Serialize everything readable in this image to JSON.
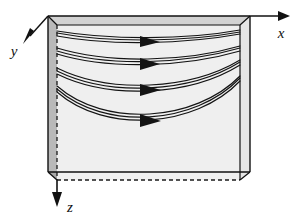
{
  "figure": {
    "title": "",
    "type": "3d-duct-streamline-diagram",
    "background_color": "#ffffff",
    "line_color": "#1a1a1a"
  },
  "axes": {
    "x": {
      "label": "x",
      "direction": "right",
      "label_x": 281,
      "label_y": 33
    },
    "y": {
      "label": "y",
      "direction": "down-left",
      "label_x": 14,
      "label_y": 53
    },
    "z": {
      "label": "z",
      "direction": "down",
      "label_x": 66,
      "label_y": 211
    }
  },
  "box": {
    "name": "duct",
    "front_face_color": "#efefef",
    "side_face_color": "#b9b9b9",
    "bottom_face_color": "#a8a8a8",
    "top_face_color": "#cfcfcf",
    "edge_color": "#111111",
    "hidden_edge_style": "dashed",
    "front_top_left": [
      57,
      25
    ],
    "front_top_right": [
      240,
      25
    ],
    "front_bottom_right": [
      240,
      180
    ],
    "front_bottom_left": [
      57,
      180
    ],
    "back_top_left": [
      48,
      16
    ],
    "back_top_right": [
      250,
      16
    ],
    "back_bottom_right": [
      250,
      172
    ],
    "back_bottom_left": [
      48,
      172
    ]
  },
  "streamlines": {
    "count": 4,
    "strands_per_bundle": 3,
    "arrowhead_count": 4,
    "description": "Four bundles of curved streamlines entering at the left wall and bending downward then recovering toward the right wall, each with a mid-path arrowhead pointing right.",
    "bundles": [
      {
        "name": "streamline-1",
        "start": [
          57,
          33
        ],
        "sag": 6,
        "end": [
          240,
          32
        ],
        "arrow_at": [
          152,
          37
        ]
      },
      {
        "name": "streamline-2",
        "start": [
          57,
          50
        ],
        "sag": 11,
        "end": [
          240,
          48
        ],
        "arrow_at": [
          152,
          60
        ]
      },
      {
        "name": "streamline-3",
        "start": [
          57,
          70
        ],
        "sag": 18,
        "end": [
          240,
          62
        ],
        "arrow_at": [
          152,
          86
        ]
      },
      {
        "name": "streamline-4",
        "start": [
          57,
          88
        ],
        "sag": 28,
        "end": [
          240,
          78
        ],
        "arrow_at": [
          152,
          117
        ]
      }
    ]
  }
}
